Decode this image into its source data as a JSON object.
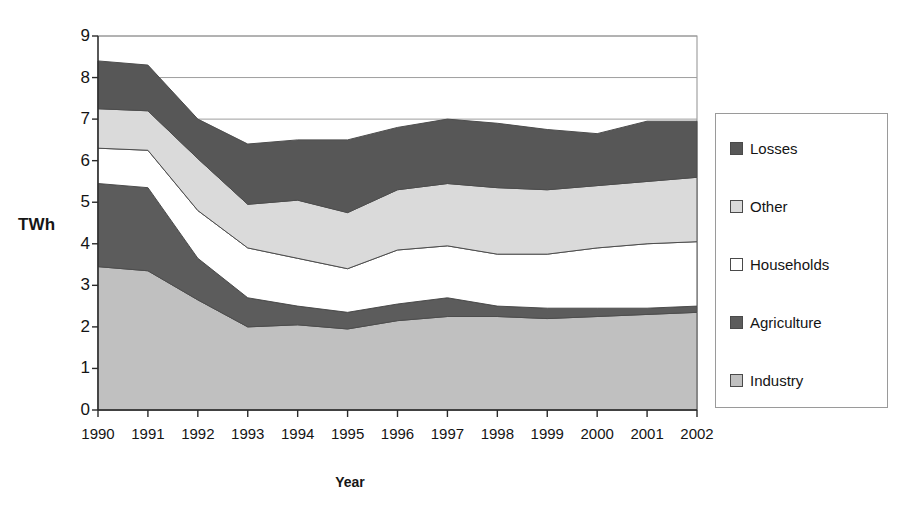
{
  "chart_data": {
    "type": "area",
    "stacked": true,
    "title": "",
    "xlabel": "Year",
    "ylabel": "TWh",
    "categories": [
      "1990",
      "1991",
      "1992",
      "1993",
      "1994",
      "1995",
      "1996",
      "1997",
      "1998",
      "1999",
      "2000",
      "2001",
      "2002"
    ],
    "x": [
      1990,
      1991,
      1992,
      1993,
      1994,
      1995,
      1996,
      1997,
      1998,
      1999,
      2000,
      2001,
      2002
    ],
    "ylim": [
      0,
      9
    ],
    "yticks": [
      0,
      1,
      2,
      3,
      4,
      5,
      6,
      7,
      8,
      9
    ],
    "grid": "horizontal",
    "legend_position": "right",
    "series": [
      {
        "name": "Industry",
        "color": "#c0c0c0",
        "values": [
          3.45,
          3.35,
          2.65,
          2.0,
          2.05,
          1.95,
          2.15,
          2.25,
          2.25,
          2.2,
          2.25,
          2.3,
          2.35
        ]
      },
      {
        "name": "Agriculture",
        "color": "#5c5c5c",
        "values": [
          2.0,
          2.0,
          1.0,
          0.7,
          0.45,
          0.4,
          0.4,
          0.45,
          0.25,
          0.25,
          0.2,
          0.15,
          0.15
        ]
      },
      {
        "name": "Households",
        "color": "#ffffff",
        "values": [
          0.85,
          0.9,
          1.15,
          1.2,
          1.15,
          1.05,
          1.3,
          1.25,
          1.25,
          1.3,
          1.45,
          1.55,
          1.55
        ]
      },
      {
        "name": "Other",
        "color": "#dadada",
        "values": [
          0.95,
          0.95,
          1.25,
          1.05,
          1.4,
          1.35,
          1.45,
          1.5,
          1.6,
          1.55,
          1.5,
          1.5,
          1.55
        ]
      },
      {
        "name": "Losses",
        "color": "#575757",
        "values": [
          1.15,
          1.1,
          0.95,
          1.45,
          1.45,
          1.75,
          1.5,
          1.55,
          1.55,
          1.45,
          1.25,
          1.45,
          1.35
        ]
      }
    ],
    "stack_tops": {
      "industry": [
        3.45,
        3.35,
        2.65,
        2.0,
        2.05,
        1.95,
        2.15,
        2.25,
        2.25,
        2.2,
        2.25,
        2.3,
        2.35
      ],
      "agriculture": [
        5.45,
        5.35,
        3.65,
        2.7,
        2.5,
        2.35,
        2.55,
        2.7,
        2.5,
        2.45,
        2.45,
        2.45,
        2.5
      ],
      "households": [
        6.3,
        6.25,
        4.8,
        3.9,
        3.65,
        3.4,
        3.85,
        3.95,
        3.75,
        3.75,
        3.9,
        4.0,
        4.05
      ],
      "other": [
        7.25,
        7.2,
        6.05,
        4.95,
        5.05,
        4.75,
        5.3,
        5.45,
        5.35,
        5.3,
        5.4,
        5.5,
        5.6
      ],
      "total": [
        8.4,
        8.3,
        7.0,
        6.4,
        6.5,
        6.5,
        6.8,
        7.0,
        6.9,
        6.75,
        6.65,
        6.95,
        6.95
      ]
    }
  },
  "axes": {
    "y_title": "TWh",
    "x_title": "Year",
    "y_tick_labels": [
      "9",
      "8",
      "7",
      "6",
      "5",
      "4",
      "3",
      "2",
      "1",
      "0"
    ],
    "x_tick_labels": [
      "1990",
      "1991",
      "1992",
      "1993",
      "1994",
      "1995",
      "1996",
      "1997",
      "1998",
      "1999",
      "2000",
      "2001",
      "2002"
    ]
  },
  "legend": {
    "items": [
      {
        "label": "Losses",
        "color": "#575757"
      },
      {
        "label": "Other",
        "color": "#dadada"
      },
      {
        "label": "Households",
        "color": "#ffffff"
      },
      {
        "label": "Agriculture",
        "color": "#5c5c5c"
      },
      {
        "label": "Industry",
        "color": "#c0c0c0"
      }
    ]
  }
}
